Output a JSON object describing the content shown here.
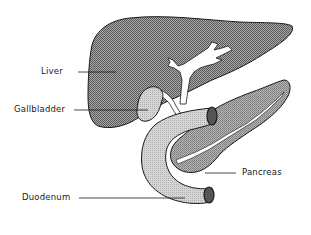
{
  "diagram": {
    "type": "anatomical illustration",
    "style": "black and white stippled line drawing",
    "labels": {
      "liver": "Liver",
      "gallbladder": "Gallbladder",
      "pancreas": "Pancreas",
      "duodenum": "Duodenum"
    },
    "colors": {
      "liver_fill": "#8a8a8a",
      "gallbladder_fill": "#c8c8c8",
      "duodenum_fill": "#c4c4c4",
      "pancreas_fill": "#9a9a9a",
      "duct_fill": "#ffffff",
      "duodenum_lumen": "#555555",
      "outline": "#1a1a1a"
    }
  }
}
